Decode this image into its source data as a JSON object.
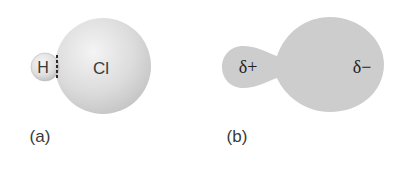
{
  "figure": {
    "panel_a": {
      "caption": "(a)",
      "atoms": [
        {
          "symbol": "H",
          "role": "small-sphere"
        },
        {
          "symbol": "Cl",
          "role": "large-sphere"
        }
      ],
      "bond_style": "dashed"
    },
    "panel_b": {
      "caption": "(b)",
      "charges": [
        {
          "label": "δ+",
          "role": "small-lobe"
        },
        {
          "label": "δ−",
          "role": "large-lobe"
        }
      ]
    },
    "colors": {
      "sphere_light": "#f2f2f2",
      "sphere_mid": "#d6d6d6",
      "sphere_dark": "#bdbdbd",
      "cloud_fill": "#cfcfcf",
      "text_dark": "#1e1e1e",
      "text_label": "#3a3a3a"
    }
  }
}
